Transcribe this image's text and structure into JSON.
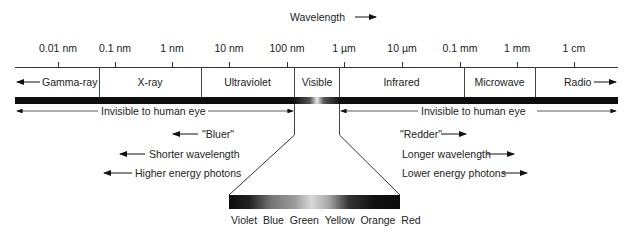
{
  "header": {
    "axis_title": "Wavelength"
  },
  "ticks": [
    {
      "label": "0.01 nm",
      "x": 58
    },
    {
      "label": "0.1 nm",
      "x": 115
    },
    {
      "label": "1 nm",
      "x": 172
    },
    {
      "label": "10 nm",
      "x": 229
    },
    {
      "label": "100 nm",
      "x": 287
    },
    {
      "label": "1 µm",
      "x": 344
    },
    {
      "label": "10 µm",
      "x": 402
    },
    {
      "label": "0.1 mm",
      "x": 460
    },
    {
      "label": "1 mm",
      "x": 517
    },
    {
      "label": "1 cm",
      "x": 574
    }
  ],
  "bands": [
    {
      "label": "Gamma-ray",
      "x0": 15,
      "x1": 99
    },
    {
      "label": "X-ray",
      "x0": 99,
      "x1": 201
    },
    {
      "label": "Ultraviolet",
      "x0": 201,
      "x1": 294
    },
    {
      "label": "Visible",
      "x0": 294,
      "x1": 339
    },
    {
      "label": "Infrared",
      "x0": 339,
      "x1": 464
    },
    {
      "label": "Microwave",
      "x0": 464,
      "x1": 535
    },
    {
      "label": "Radio",
      "x0": 535,
      "x1": 618
    }
  ],
  "invisible": {
    "left": "Invisible to human eye",
    "right": "Invisible to human eye"
  },
  "left_notes": [
    "\"Bluer\"",
    "Shorter wavelength",
    "Higher energy photons"
  ],
  "right_notes": [
    "\"Redder\"",
    "Longer wavelength",
    "Lower energy photons"
  ],
  "visible_colors": [
    "Violet",
    "Blue",
    "Green",
    "Yellow",
    "Orange",
    "Red"
  ]
}
